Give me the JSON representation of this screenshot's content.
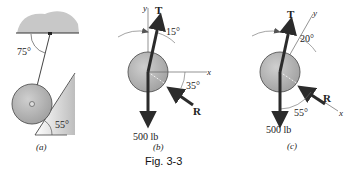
{
  "figure": {
    "caption": "Fig. 3-3",
    "panels": [
      {
        "id": "a",
        "label": "(a)",
        "angles": {
          "rope_to_ceiling": "75°",
          "incline": "55°"
        }
      },
      {
        "id": "b",
        "label": "(b)",
        "axes": {
          "x": "x",
          "y": "y"
        },
        "forces": {
          "tension": "T",
          "reaction": "R",
          "weight": "500 lb"
        },
        "angles": {
          "tension_from_y": "15°",
          "reaction_below_x": "35°"
        }
      },
      {
        "id": "c",
        "label": "(c)",
        "axes": {
          "x": "x",
          "y": "y"
        },
        "forces": {
          "tension": "T",
          "reaction": "R",
          "weight": "500 lb"
        },
        "angles": {
          "y_axis_from_vertical": "20°",
          "weight_to_x": "55°"
        }
      }
    ]
  },
  "colors": {
    "wheel_fill": "#b8b8b8",
    "wheel_stroke": "#555555",
    "ceiling_fill": "#c9c9c9",
    "arrow": "#2b2b2b",
    "line": "#444444"
  }
}
